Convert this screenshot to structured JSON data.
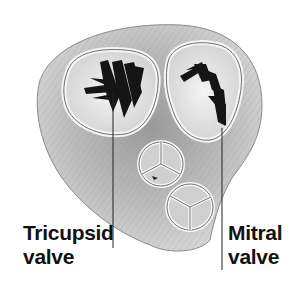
{
  "figure": {
    "colors": {
      "background": "#ffffff",
      "tissue_light": "#e6e6e6",
      "tissue_mid": "#b8b8b8",
      "tissue_dark": "#7a7a7a",
      "ring": "#f2f2f2",
      "leaflet_dark": "#151515",
      "text": "#111111"
    }
  },
  "labels": {
    "tricuspid": {
      "line1": "Tricupsid",
      "line2": "valve"
    },
    "mitral": {
      "line1": "Mitral",
      "line2": "valve"
    }
  }
}
